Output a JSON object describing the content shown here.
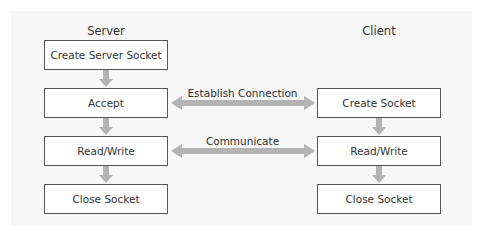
{
  "diagram": {
    "server": {
      "label": "Server",
      "steps": [
        "Create Server Socket",
        "Accept",
        "Read/Write",
        "Close Socket"
      ]
    },
    "client": {
      "label": "Client",
      "steps": [
        "Create Socket",
        "Read/Write",
        "Close Socket"
      ]
    },
    "connections": [
      {
        "label": "Establish Connection",
        "from": "Accept",
        "to": "Create Socket",
        "direction": "bidirectional"
      },
      {
        "label": "Communicate",
        "from": "Read/Write",
        "to": "Read/Write",
        "direction": "bidirectional"
      }
    ],
    "colors": {
      "arrow": "#b3b3b3",
      "box_border": "#555555",
      "panel_bg": "#f7f7f7"
    }
  }
}
